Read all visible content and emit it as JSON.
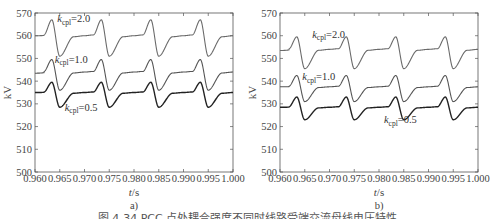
{
  "caption": "图 4-34  PCC 点处耦合强度不同时线路受端交流母线电压特性",
  "chart_data": [
    {
      "type": "line",
      "panel_label": "a)",
      "xlabel": "t/s",
      "ylabel": "kV",
      "xlim": [
        0.96,
        1.0
      ],
      "ylim": [
        500,
        570
      ],
      "xticks": [
        "0.960",
        "0.965",
        "0.970",
        "0.975",
        "0.980",
        "0.985",
        "0.990",
        "0.995",
        "1.000"
      ],
      "yticks": [
        "500",
        "510",
        "520",
        "530",
        "540",
        "550",
        "560",
        "570"
      ],
      "grid": false,
      "period_s": 0.01,
      "series": [
        {
          "name": "k_cpl=2.0",
          "label_main": "k",
          "label_sub": "cpl",
          "label_val": "=2.0",
          "color": "#6a6a6a",
          "width": 1.1,
          "start": 560,
          "peak": 567,
          "peak_t": 0.9634,
          "trough": 551,
          "trough_t": 0.965,
          "plateau": 560,
          "end": 560,
          "label_x": 0.9645,
          "label_y": 566
        },
        {
          "name": "k_cpl=1.0",
          "label_main": "k",
          "label_sub": "cpl",
          "label_val": "=1.0",
          "color": "#555555",
          "width": 1.1,
          "start": 543.5,
          "peak": 549.5,
          "peak_t": 0.9634,
          "trough": 536,
          "trough_t": 0.965,
          "plateau": 544,
          "end": 544,
          "label_x": 0.964,
          "label_y": 548
        },
        {
          "name": "k_cpl=0.5",
          "label_main": "k",
          "label_sub": "cpl",
          "label_val": "=0.5",
          "color": "#222222",
          "width": 1.4,
          "start": 535,
          "peak": 539.5,
          "peak_t": 0.9634,
          "trough": 528.5,
          "trough_t": 0.965,
          "plateau": 535,
          "end": 535,
          "label_x": 0.966,
          "label_y": 527
        }
      ]
    },
    {
      "type": "line",
      "panel_label": "b)",
      "xlabel": "t/s",
      "ylabel": "kV",
      "xlim": [
        0.96,
        1.0
      ],
      "ylim": [
        500,
        570
      ],
      "xticks": [
        "0.960",
        "0.965",
        "0.970",
        "0.975",
        "0.980",
        "0.985",
        "0.990",
        "0.995",
        "1.000"
      ],
      "yticks": [
        "500",
        "510",
        "520",
        "530",
        "540",
        "550",
        "560",
        "570"
      ],
      "grid": false,
      "period_s": 0.01,
      "series": [
        {
          "name": "k_cpl=2.0",
          "label_main": "k",
          "label_sub": "cpl",
          "label_val": "=2.0",
          "color": "#6a6a6a",
          "width": 1.1,
          "start": 553.5,
          "peak": 559.5,
          "peak_t": 0.9634,
          "trough": 545.5,
          "trough_t": 0.9652,
          "plateau": 554,
          "end": 553.5,
          "label_x": 0.9665,
          "label_y": 559
        },
        {
          "name": "k_cpl=1.0",
          "label_main": "k",
          "label_sub": "cpl",
          "label_val": "=1.0",
          "color": "#555555",
          "width": 1.1,
          "start": 537.5,
          "peak": 542.5,
          "peak_t": 0.9634,
          "trough": 531,
          "trough_t": 0.9652,
          "plateau": 537.5,
          "end": 538,
          "label_x": 0.9645,
          "label_y": 540.5
        },
        {
          "name": "k_cpl=0.5",
          "label_main": "k",
          "label_sub": "cpl",
          "label_val": "=0.5",
          "color": "#222222",
          "width": 1.4,
          "start": 528.5,
          "peak": 533,
          "peak_t": 0.9634,
          "trough": 523,
          "trough_t": 0.9652,
          "plateau": 528.5,
          "end": 529,
          "label_x": 0.981,
          "label_y": 521.5
        }
      ]
    }
  ]
}
